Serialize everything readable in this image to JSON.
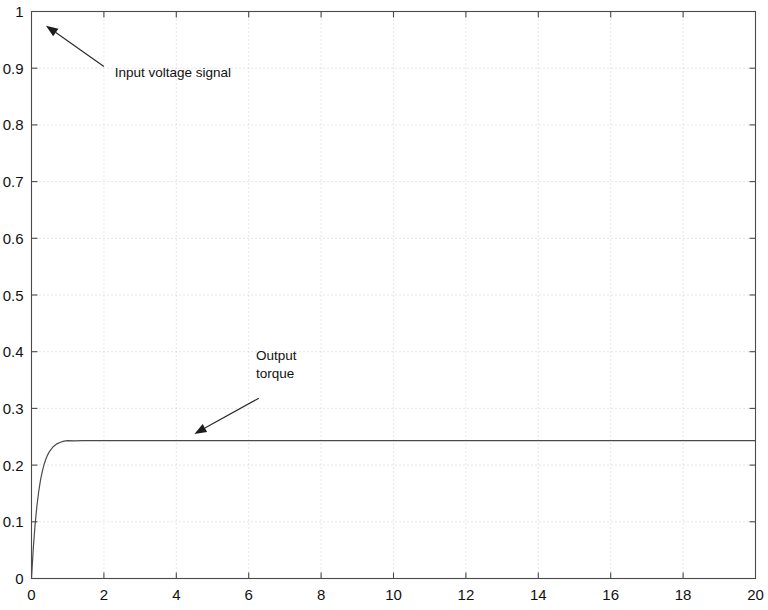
{
  "chart_data": {
    "type": "line",
    "title": "",
    "subtitle": "",
    "xlabel": "",
    "ylabel": "",
    "xlim": [
      0,
      20
    ],
    "ylim": [
      0,
      1
    ],
    "grid": true,
    "legend": null,
    "x_ticks": [
      0,
      2,
      4,
      6,
      8,
      10,
      12,
      14,
      16,
      18,
      20
    ],
    "x_tick_labels": [
      "0",
      "2",
      "4",
      "6",
      "8",
      "10",
      "12",
      "14",
      "16",
      "18",
      "20"
    ],
    "y_ticks": [
      0,
      0.1,
      0.2,
      0.3,
      0.4,
      0.5,
      0.6,
      0.7,
      0.8,
      0.9,
      1
    ],
    "y_tick_labels": [
      "0",
      "0.1",
      "0.2",
      "0.3",
      "0.4",
      "0.5",
      "0.6",
      "0.7",
      "0.8",
      "0.9",
      "1"
    ],
    "series": [
      {
        "name": "Output torque",
        "steady_state": 0.243,
        "time_constant": 0.2,
        "color": "#4a4a4a",
        "x": [
          0,
          0.05,
          0.1,
          0.15,
          0.2,
          0.25,
          0.3,
          0.35,
          0.4,
          0.45,
          0.5,
          0.6,
          0.7,
          0.8,
          0.9,
          1.0,
          1.2,
          1.4,
          1.6,
          1.8,
          2.0,
          2.5,
          3.0,
          4.0,
          5.0,
          6.0,
          8.0,
          10.0,
          12.0,
          14.0,
          16.0,
          18.0,
          20.0
        ],
        "y": [
          0,
          0.0537,
          0.0956,
          0.1284,
          0.1539,
          0.1738,
          0.1894,
          0.2016,
          0.2111,
          0.2185,
          0.2244,
          0.2325,
          0.2374,
          0.2404,
          0.2422,
          0.2433,
          0.2427,
          0.243,
          0.243,
          0.243,
          0.243,
          0.243,
          0.243,
          0.243,
          0.243,
          0.243,
          0.243,
          0.243,
          0.243,
          0.243,
          0.243,
          0.243,
          0.243
        ]
      }
    ],
    "annotations": [
      {
        "id": "input-voltage",
        "lines": [
          "Input voltage signal"
        ],
        "text_x": 2.3,
        "text_y": 0.885,
        "arrow_from": [
          2.0,
          0.903
        ],
        "arrow_to": [
          0.4,
          0.975
        ]
      },
      {
        "id": "output-torque",
        "lines": [
          "Output",
          "torque"
        ],
        "text_x": 6.2,
        "text_y": 0.385,
        "arrow_from": [
          6.28,
          0.318
        ],
        "arrow_to": [
          4.5,
          0.255
        ]
      }
    ]
  },
  "figure": {
    "background": "#ffffff",
    "axis_color": "#4a4a4a",
    "grid_color": "#c9c9c9",
    "text_color": "#111111"
  }
}
